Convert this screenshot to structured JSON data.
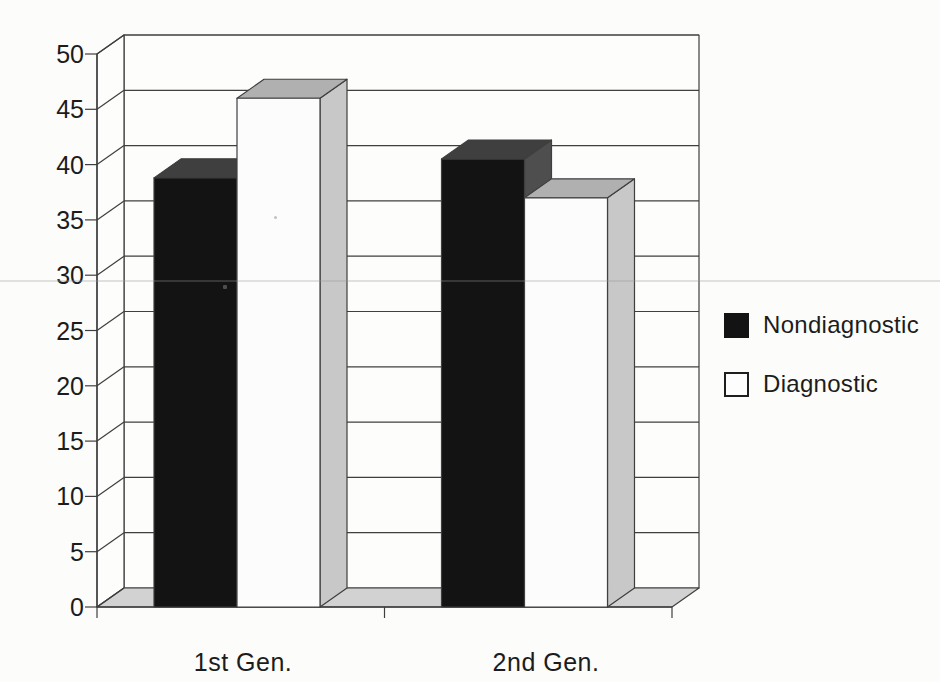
{
  "page": {
    "background": "#fcfcfa",
    "text_color": "#1c1c1c"
  },
  "chart_data": {
    "type": "bar",
    "projection": "3d-column",
    "title": "",
    "xlabel": "",
    "ylabel": "",
    "categories": [
      "1st Gen.",
      "2nd Gen."
    ],
    "series": [
      {
        "name": "Nondiagnostic",
        "color": "#131313",
        "top_shade": "#3f3f3f",
        "side_shade": "#4e4e4e",
        "values": [
          38.8,
          40.5
        ]
      },
      {
        "name": "Diagnostic",
        "color": "#fcfcfc",
        "top_shade": "#b0b0b0",
        "side_shade": "#c8c8c8",
        "values": [
          46,
          37
        ]
      }
    ],
    "ylim": [
      0,
      50
    ],
    "y_ticks": [
      0,
      5,
      10,
      15,
      20,
      25,
      30,
      35,
      40,
      45,
      50
    ],
    "grid": true,
    "legend_position": "right",
    "wall_color": "#fdfdfc",
    "floor_color": "#d2d2d2",
    "line_color": "#3f3f3f"
  }
}
